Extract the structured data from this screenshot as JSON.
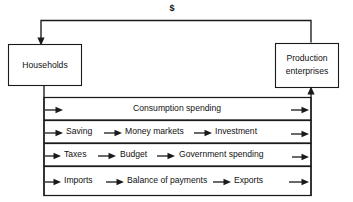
{
  "diagram": {
    "currency_marker": "$",
    "nodes": {
      "households": {
        "label": "Households"
      },
      "production": {
        "label_line1": "Production",
        "label_line2": "enterprises"
      }
    },
    "flows": [
      {
        "id": "consumption",
        "labels": [
          "Consumption spending"
        ],
        "arrow_count": 2
      },
      {
        "id": "saving-investment",
        "labels": [
          "Saving",
          "Money markets",
          "Investment"
        ],
        "arrow_count": 4
      },
      {
        "id": "taxes-government",
        "labels": [
          "Taxes",
          "Budget",
          "Government spending"
        ],
        "arrow_count": 4
      },
      {
        "id": "imports-exports",
        "labels": [
          "Imports",
          "Balance of payments",
          "Exports"
        ],
        "arrow_count": 4
      }
    ],
    "colors": {
      "stroke": "#1a1a1a",
      "text": "#111111",
      "background": "#ffffff"
    }
  }
}
